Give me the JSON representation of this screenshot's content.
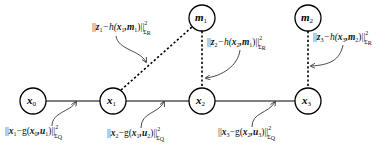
{
  "diagram": {
    "type": "factor-graph",
    "nodes": [
      {
        "id": "x0",
        "base": "x",
        "sub": "0",
        "cx": 33,
        "cy": 101,
        "kind": "pose"
      },
      {
        "id": "x1",
        "base": "x",
        "sub": "1",
        "cx": 113,
        "cy": 101,
        "kind": "pose"
      },
      {
        "id": "x2",
        "base": "x",
        "sub": "2",
        "cx": 202,
        "cy": 101,
        "kind": "pose"
      },
      {
        "id": "x3",
        "base": "x",
        "sub": "3",
        "cx": 308,
        "cy": 101,
        "kind": "pose"
      },
      {
        "id": "m1",
        "base": "m",
        "sub": "1",
        "cx": 202,
        "cy": 18,
        "kind": "landmark"
      },
      {
        "id": "m2",
        "base": "m",
        "sub": "2",
        "cx": 308,
        "cy": 18,
        "kind": "landmark"
      }
    ],
    "edges": [
      {
        "from": "x0",
        "to": "x1",
        "style": "solid"
      },
      {
        "from": "x1",
        "to": "x2",
        "style": "solid"
      },
      {
        "from": "x2",
        "to": "x3",
        "style": "solid"
      },
      {
        "from": "x1",
        "to": "m1",
        "style": "dashed"
      },
      {
        "from": "x2",
        "to": "m1",
        "style": "dashed"
      },
      {
        "from": "x3",
        "to": "m2",
        "style": "dashed"
      }
    ],
    "annotations": {
      "obs1": {
        "pre": "||",
        "a": "z",
        "a_sub": "1",
        "mid": "−h(",
        "b": "x",
        "b_sub": "1",
        "c": ",m",
        "c_sub": "1",
        "post": ")||",
        "sup": "2",
        "cov": "Σ",
        "cov_sub": "R"
      },
      "obs2": {
        "pre": "||",
        "a": "z",
        "a_sub": "2",
        "mid": "−h(",
        "b": "x",
        "b_sub": "2",
        "c": ",m",
        "c_sub": "1",
        "post": ")||",
        "sup": "2",
        "cov": "Σ",
        "cov_sub": "R"
      },
      "obs3": {
        "pre": "||",
        "a": "z",
        "a_sub": "3",
        "mid": "−h(",
        "b": "x",
        "b_sub": "3",
        "c": ",m",
        "c_sub": "2",
        "post": ")||",
        "sup": "2",
        "cov": "Σ",
        "cov_sub": "R"
      },
      "mot1": {
        "pre": "||",
        "a": "x",
        "a_sub": "1",
        "mid": "−g(",
        "b": "x",
        "b_sub": "0",
        "c": ",u",
        "c_sub": "1",
        "post": ")||",
        "sup": "2",
        "cov": "Σ",
        "cov_sub": "Q"
      },
      "mot2": {
        "pre": "||",
        "a": "x",
        "a_sub": "2",
        "mid": "−g(",
        "b": "x",
        "b_sub": "1",
        "c": ",u",
        "c_sub": "2",
        "post": ")||",
        "sup": "2",
        "cov": "Σ",
        "cov_sub": "Q"
      },
      "mot3": {
        "pre": "||",
        "a": "x",
        "a_sub": "3",
        "mid": "−g(",
        "b": "x",
        "b_sub": "2",
        "c": ",u",
        "c_sub": "3",
        "post": ")||",
        "sup": "2",
        "cov": "Σ",
        "cov_sub": "Q"
      }
    },
    "nodeLabels": {
      "x0": {
        "base": "x",
        "sub": "0"
      },
      "x1": {
        "base": "x",
        "sub": "1"
      },
      "x2": {
        "base": "x",
        "sub": "2"
      },
      "x3": {
        "base": "x",
        "sub": "3"
      },
      "m1": {
        "base": "m",
        "sub": "1"
      },
      "m2": {
        "base": "m",
        "sub": "2"
      }
    }
  }
}
